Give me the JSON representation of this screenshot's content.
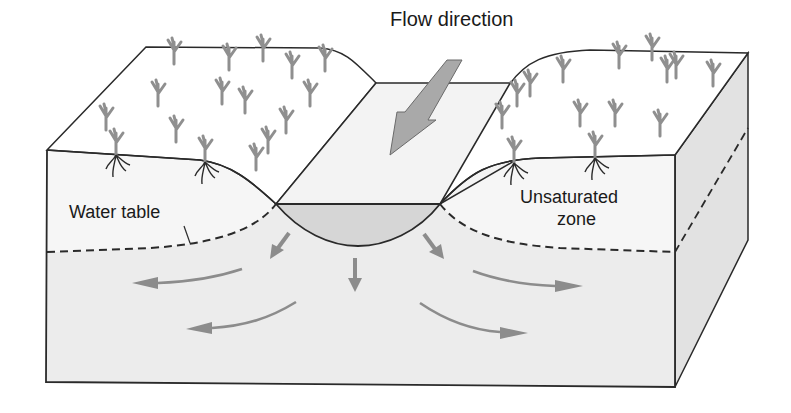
{
  "diagram": {
    "type": "block-diagram",
    "colors": {
      "outline": "#2a2a2a",
      "unsaturated_fill": "#f6f6f6",
      "saturated_fill": "#ececec",
      "side_face_fill": "#e2e2e2",
      "channel_water_fill": "#d6d6d6",
      "arrow_fill": "#8c8c8c",
      "vegetation": "#8f8f8f",
      "roots": "#2a2a2a"
    }
  },
  "labels": {
    "flow_direction": "Flow direction",
    "water_table": "Water table",
    "unsaturated_zone_line1": "Unsaturated",
    "unsaturated_zone_line2": "zone"
  },
  "arrows": {
    "flow_direction": {
      "meaning": "Downstream flow along channel"
    },
    "seepage": [
      {
        "id": "seep-left",
        "direction": "down-left"
      },
      {
        "id": "seep-center",
        "direction": "down"
      },
      {
        "id": "seep-right",
        "direction": "down-right"
      }
    ],
    "groundwater": [
      {
        "id": "gw-left-upper",
        "direction": "left"
      },
      {
        "id": "gw-left-lower",
        "direction": "left"
      },
      {
        "id": "gw-right-upper",
        "direction": "right"
      },
      {
        "id": "gw-right-lower",
        "direction": "right"
      }
    ]
  }
}
